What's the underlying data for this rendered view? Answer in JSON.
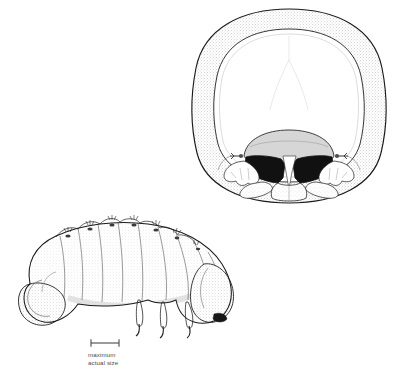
{
  "figure": {
    "background_color": "#ffffff",
    "ink_color": "#1a1a1a",
    "stipple_color": "#8a8a8a",
    "mandible_color": "#111111",
    "clypeus_color": "#d6d6d6",
    "panels": [
      {
        "id": "head-capsule",
        "label": "head capsule, frontal view",
        "view": "frontal",
        "position": "upper-right",
        "parts": [
          "epicranium",
          "frontal suture",
          "clypeus",
          "labrum",
          "left mandible",
          "right mandible",
          "left antenna",
          "right antenna",
          "maxillae",
          "labium"
        ]
      },
      {
        "id": "larva-habitus",
        "label": "larva, lateral view",
        "view": "lateral",
        "body_form": "scarabaeiform, C-shaped",
        "position": "lower-left",
        "parts": [
          "head",
          "thoracic legs",
          "tarsal claws",
          "thoracic segments",
          "abdominal segments",
          "spiracles",
          "setae",
          "swollen terminal abdomen"
        ]
      }
    ]
  },
  "scale": {
    "caption_line1": "maximum",
    "caption_line2": "actual size",
    "bar_length_px": 28,
    "bar_icon": "scale-bar-icon"
  }
}
